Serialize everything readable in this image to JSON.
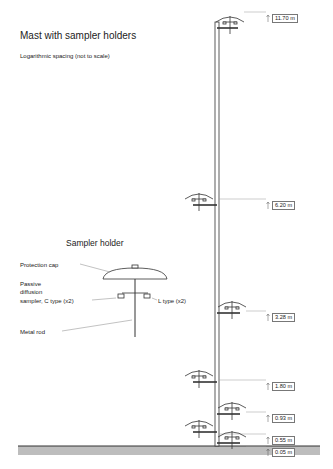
{
  "title": "Mast with sampler holders",
  "subtitle": "Logarithmic spacing (not to scale)",
  "detail": {
    "title": "Sampler holder",
    "labels": {
      "cap": "Protection cap",
      "passive": [
        "Passive",
        "diffusion",
        "sampler, C type (x2)"
      ],
      "ltype": "L type (x2)",
      "rod": "Metal rod"
    }
  },
  "heights": [
    "11.70 m",
    "6.20 m",
    "3.28 m",
    "1.80 m",
    "0.93 m",
    "0.55 m",
    "0.05 m"
  ],
  "colors": {
    "line": "#333333",
    "ground": "#bdbdbd",
    "leader": "#999999"
  }
}
